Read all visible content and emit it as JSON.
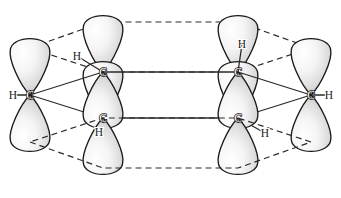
{
  "figure": {
    "background_color": "#ffffff",
    "outline_color": "#1a1a1a",
    "lobe_fill_light": "#fbfbfb",
    "lobe_fill_dark": "#b9b9b9",
    "bond_color": "#2a2a2a",
    "ring_dash_color": "#2a2a2a"
  },
  "chart_data": {
    "type": "diagram",
    "xlabel": "",
    "ylabel": "",
    "atoms": [
      {
        "id": "C1",
        "element": "C",
        "label": "C",
        "x": 30,
        "y": 95,
        "position": "front-left"
      },
      {
        "id": "C2",
        "element": "C",
        "label": "C",
        "x": 103,
        "y": 72,
        "position": "back-left-upper"
      },
      {
        "id": "C3",
        "element": "C",
        "label": "C",
        "x": 103,
        "y": 118,
        "position": "front-left-lower"
      },
      {
        "id": "C4",
        "element": "C",
        "label": "C",
        "x": 238,
        "y": 72,
        "position": "back-right-upper"
      },
      {
        "id": "C5",
        "element": "C",
        "label": "C",
        "x": 238,
        "y": 118,
        "position": "front-right-lower"
      },
      {
        "id": "C6",
        "element": "C",
        "label": "C",
        "x": 311,
        "y": 95,
        "position": "front-right"
      }
    ],
    "hydrogens": [
      {
        "id": "H1",
        "element": "H",
        "label": "H",
        "x": 13,
        "y": 95,
        "bonded_to": "C1"
      },
      {
        "id": "H2",
        "element": "H",
        "label": "H",
        "x": 77,
        "y": 56,
        "bonded_to": "C2"
      },
      {
        "id": "H3",
        "element": "H",
        "label": "H",
        "x": 99,
        "y": 132,
        "bonded_to": "C3"
      },
      {
        "id": "H4",
        "element": "H",
        "label": "H",
        "x": 242,
        "y": 44,
        "bonded_to": "C4"
      },
      {
        "id": "H5",
        "element": "H",
        "label": "H",
        "x": 265,
        "y": 133,
        "bonded_to": "C5"
      },
      {
        "id": "H6",
        "element": "H",
        "label": "H",
        "x": 329,
        "y": 95,
        "bonded_to": "C6"
      }
    ],
    "sigma_bonds": [
      {
        "from": "H1",
        "to": "C1",
        "style": "solid"
      },
      {
        "from": "H2",
        "to": "C2",
        "style": "solid"
      },
      {
        "from": "H3",
        "to": "C3",
        "style": "solid"
      },
      {
        "from": "H4",
        "to": "C4",
        "style": "solid"
      },
      {
        "from": "H5",
        "to": "C5",
        "style": "solid"
      },
      {
        "from": "H6",
        "to": "C6",
        "style": "solid"
      },
      {
        "from": "C1",
        "to": "C2",
        "style": "solid"
      },
      {
        "from": "C1",
        "to": "C3",
        "style": "solid"
      },
      {
        "from": "C2",
        "to": "C4",
        "style": "solid"
      },
      {
        "from": "C3",
        "to": "C5",
        "style": "solid"
      },
      {
        "from": "C4",
        "to": "C6",
        "style": "solid"
      },
      {
        "from": "C5",
        "to": "C6",
        "style": "solid"
      }
    ],
    "ring_outline": {
      "style": "dashed",
      "description": "Dashed hexagonal ring drawn in perspective through the p-orbital lobe tips, above and below the carbon plane",
      "top_hexagon": [
        [
          30,
          48
        ],
        [
          103,
          22
        ],
        [
          238,
          22
        ],
        [
          311,
          48
        ],
        [
          238,
          72
        ],
        [
          103,
          72
        ]
      ],
      "bottom_hexagon": [
        [
          30,
          142
        ],
        [
          103,
          168
        ],
        [
          238,
          168
        ],
        [
          311,
          142
        ],
        [
          238,
          118
        ],
        [
          103,
          118
        ]
      ]
    },
    "orbitals": {
      "type": "p-orbital",
      "count": 12,
      "per_atom": 2,
      "description": "Each carbon carries one p orbital with a lobe above and a lobe below the ring plane; adjacent lobes overlap sideways to form the pi system.",
      "lobes": [
        {
          "atom": "C1",
          "cx": 30,
          "cy": 95,
          "dir": "up",
          "h": 52,
          "w": 42,
          "tilt": 0
        },
        {
          "atom": "C1",
          "cx": 30,
          "cy": 95,
          "dir": "down",
          "h": 52,
          "w": 42,
          "tilt": 0
        },
        {
          "atom": "C2",
          "cx": 103,
          "cy": 72,
          "dir": "up",
          "h": 52,
          "w": 42,
          "tilt": 0
        },
        {
          "atom": "C2",
          "cx": 103,
          "cy": 72,
          "dir": "down",
          "h": 52,
          "w": 42,
          "tilt": 0
        },
        {
          "atom": "C3",
          "cx": 103,
          "cy": 118,
          "dir": "up",
          "h": 52,
          "w": 42,
          "tilt": 0
        },
        {
          "atom": "C3",
          "cx": 103,
          "cy": 118,
          "dir": "down",
          "h": 52,
          "w": 42,
          "tilt": 0
        },
        {
          "atom": "C4",
          "cx": 238,
          "cy": 72,
          "dir": "up",
          "h": 52,
          "w": 42,
          "tilt": 0
        },
        {
          "atom": "C4",
          "cx": 238,
          "cy": 72,
          "dir": "down",
          "h": 52,
          "w": 42,
          "tilt": 0
        },
        {
          "atom": "C5",
          "cx": 238,
          "cy": 118,
          "dir": "up",
          "h": 52,
          "w": 42,
          "tilt": 0
        },
        {
          "atom": "C5",
          "cx": 238,
          "cy": 118,
          "dir": "down",
          "h": 52,
          "w": 42,
          "tilt": 0
        },
        {
          "atom": "C6",
          "cx": 311,
          "cy": 95,
          "dir": "up",
          "h": 52,
          "w": 42,
          "tilt": 0
        },
        {
          "atom": "C6",
          "cx": 311,
          "cy": 95,
          "dir": "down",
          "h": 52,
          "w": 42,
          "tilt": 0
        }
      ]
    }
  }
}
